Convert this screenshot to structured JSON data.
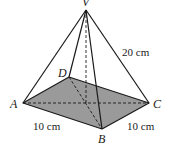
{
  "diagram": {
    "type": "square-based pyramid",
    "vertices": {
      "V": "V",
      "A": "A",
      "B": "B",
      "C": "C",
      "D": "D"
    },
    "measurements": {
      "slant_edge_VC": "20 cm",
      "base_edge_AB": "10 cm",
      "base_edge_BC": "10 cm"
    },
    "colors": {
      "base_fill": "#9a9a9a",
      "line": "#1a1a1a"
    }
  }
}
